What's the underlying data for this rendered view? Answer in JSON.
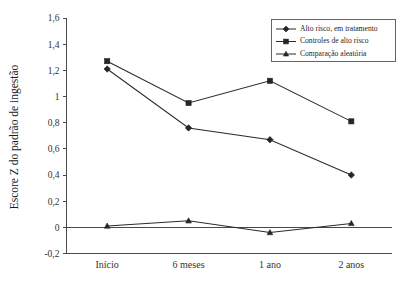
{
  "chart_data": {
    "type": "line",
    "title": "",
    "xlabel": "",
    "ylabel": "Escore Z do padrão de ingestão",
    "categories": [
      "Início",
      "6 meses",
      "1 ano",
      "2 anos"
    ],
    "ylim": [
      -0.2,
      1.6
    ],
    "ytick_labels": [
      "1,6",
      "1,4",
      "1,2",
      "1",
      "0,8",
      "0,6",
      "0,4",
      "0,2",
      "0",
      "-0,2"
    ],
    "ytick_values": [
      1.6,
      1.4,
      1.2,
      1.0,
      0.8,
      0.6,
      0.4,
      0.2,
      0.0,
      -0.2
    ],
    "grid": false,
    "zero_line": true,
    "legend_position": "top-right",
    "series": [
      {
        "name": "Alto risco, em tratamento",
        "marker": "diamond",
        "values": [
          1.21,
          0.76,
          0.67,
          0.4
        ]
      },
      {
        "name": "Controles de alto risco",
        "marker": "square",
        "values": [
          1.27,
          0.95,
          1.12,
          0.81
        ]
      },
      {
        "name": "Comparação aleatória",
        "marker": "triangle",
        "values": [
          0.01,
          0.05,
          -0.04,
          0.03
        ]
      }
    ]
  },
  "colors": {
    "line": "#2b2b2b",
    "axis": "#4a4a4a",
    "text": "#1a1a1a",
    "background": "#ffffff"
  }
}
